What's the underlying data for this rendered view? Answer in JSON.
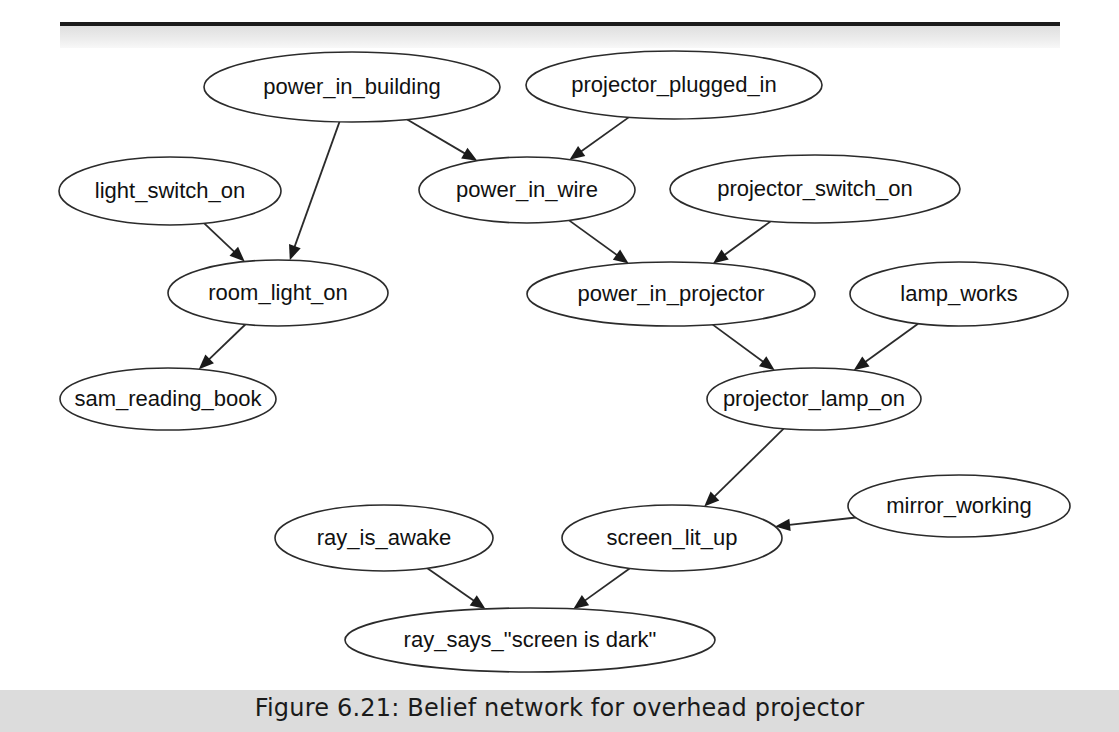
{
  "figure": {
    "caption": "Figure 6.21: Belief network for overhead projector",
    "width": 1119,
    "height": 732,
    "background_color": "#ffffff",
    "rule_color": "#1b1b1b",
    "caption_band_color": "#dcdcdc"
  },
  "chart_data": {
    "type": "diagram",
    "subtype": "belief-network",
    "title": "Figure 6.21: Belief network for overhead projector",
    "node_shape": "ellipse",
    "node_fill": "#ffffff",
    "node_stroke": "#2b2b2b",
    "edge_color": "#2b2b2b",
    "directed": true,
    "nodes": [
      {
        "id": "power_in_building",
        "label": "power_in_building",
        "cx": 352,
        "cy": 87,
        "rx": 148,
        "ry": 35,
        "font_size": 22
      },
      {
        "id": "projector_plugged_in",
        "label": "projector_plugged_in",
        "cx": 674,
        "cy": 85,
        "rx": 148,
        "ry": 34,
        "font_size": 22
      },
      {
        "id": "light_switch_on",
        "label": "light_switch_on",
        "cx": 170,
        "cy": 191,
        "rx": 111,
        "ry": 34,
        "font_size": 22
      },
      {
        "id": "power_in_wire",
        "label": "power_in_wire",
        "cx": 527,
        "cy": 190,
        "rx": 108,
        "ry": 33,
        "font_size": 22
      },
      {
        "id": "projector_switch_on",
        "label": "projector_switch_on",
        "cx": 815,
        "cy": 189,
        "rx": 145,
        "ry": 34,
        "font_size": 22
      },
      {
        "id": "room_light_on",
        "label": "room_light_on",
        "cx": 278,
        "cy": 293,
        "rx": 110,
        "ry": 33,
        "font_size": 22
      },
      {
        "id": "power_in_projector",
        "label": "power_in_projector",
        "cx": 671,
        "cy": 294,
        "rx": 144,
        "ry": 32,
        "font_size": 22
      },
      {
        "id": "lamp_works",
        "label": "lamp_works",
        "cx": 959,
        "cy": 294,
        "rx": 109,
        "ry": 32,
        "font_size": 22
      },
      {
        "id": "sam_reading_book",
        "label": "sam_reading_book",
        "cx": 168,
        "cy": 399,
        "rx": 108,
        "ry": 31,
        "font_size": 22
      },
      {
        "id": "projector_lamp_on",
        "label": "projector_lamp_on",
        "cx": 814,
        "cy": 399,
        "rx": 107,
        "ry": 31,
        "font_size": 22
      },
      {
        "id": "mirror_working",
        "label": "mirror_working",
        "cx": 959,
        "cy": 506,
        "rx": 111,
        "ry": 31,
        "font_size": 22
      },
      {
        "id": "ray_is_awake",
        "label": "ray_is_awake",
        "cx": 384,
        "cy": 538,
        "rx": 109,
        "ry": 33,
        "font_size": 22
      },
      {
        "id": "screen_lit_up",
        "label": "screen_lit_up",
        "cx": 672,
        "cy": 538,
        "rx": 110,
        "ry": 33,
        "font_size": 22
      },
      {
        "id": "ray_says_screen_dark",
        "label": "ray_says_\"screen is dark\"",
        "cx": 530,
        "cy": 640,
        "rx": 185,
        "ry": 32,
        "font_size": 22
      }
    ],
    "edges": [
      {
        "from": "power_in_building",
        "to": "room_light_on"
      },
      {
        "from": "power_in_building",
        "to": "power_in_wire"
      },
      {
        "from": "projector_plugged_in",
        "to": "power_in_wire"
      },
      {
        "from": "light_switch_on",
        "to": "room_light_on"
      },
      {
        "from": "power_in_wire",
        "to": "power_in_projector"
      },
      {
        "from": "projector_switch_on",
        "to": "power_in_projector"
      },
      {
        "from": "room_light_on",
        "to": "sam_reading_book"
      },
      {
        "from": "power_in_projector",
        "to": "projector_lamp_on"
      },
      {
        "from": "lamp_works",
        "to": "projector_lamp_on"
      },
      {
        "from": "projector_lamp_on",
        "to": "screen_lit_up"
      },
      {
        "from": "mirror_working",
        "to": "screen_lit_up"
      },
      {
        "from": "ray_is_awake",
        "to": "ray_says_screen_dark"
      },
      {
        "from": "screen_lit_up",
        "to": "ray_says_screen_dark"
      }
    ]
  }
}
